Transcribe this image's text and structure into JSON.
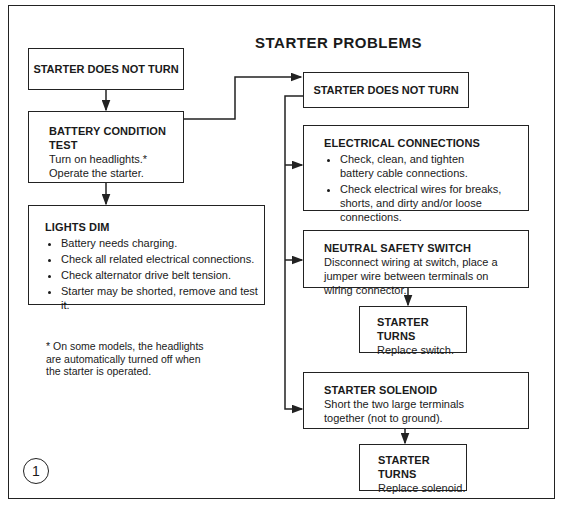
{
  "title": "STARTER PROBLEMS",
  "figure_number": "1",
  "boxes": {
    "start": {
      "heading": "STARTER DOES NOT TURN"
    },
    "battery": {
      "heading": "BATTERY CONDITION TEST",
      "lines": [
        "Turn on headlights.*",
        "Operate the starter."
      ]
    },
    "lights_dim": {
      "heading": "LIGHTS DIM",
      "bullets": [
        "Battery needs charging.",
        "Check all related electrical connections.",
        "Check alternator drive belt tension.",
        "Starter may be shorted, remove and test it."
      ]
    },
    "not_turn": {
      "heading": "STARTER DOES NOT TURN"
    },
    "electrical": {
      "heading": "ELECTRICAL CONNECTIONS",
      "bullets": [
        "Check, clean, and tighten battery cable connections.",
        "Check electrical wires for breaks, shorts, and dirty and/or loose connections."
      ]
    },
    "neutral": {
      "heading": "NEUTRAL SAFETY SWITCH",
      "text": "Disconnect wiring at switch, place a jumper wire between terminals on wiring connector."
    },
    "turns_switch": {
      "heading": "STARTER TURNS",
      "text": "Replace switch."
    },
    "solenoid": {
      "heading": "STARTER SOLENOID",
      "text": "Short the two large terminals together (not to ground)."
    },
    "turns_solenoid": {
      "heading": "STARTER TURNS",
      "text": "Replace solenoid."
    }
  },
  "footnote": "* On some models, the headlights are automatically turned off when the starter is operated."
}
